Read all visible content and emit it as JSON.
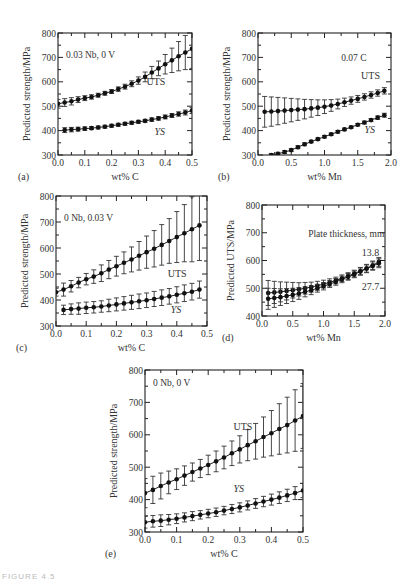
{
  "figure_caption": "FIGURE 4.5",
  "chart_data": [
    {
      "id": "a",
      "panel_label": "(a)",
      "type": "scatter",
      "title": "",
      "annotation": "0.03 Nb, 0 V",
      "xlabel": "wt% C",
      "ylabel": "Predicted strength/MPa",
      "xlim": [
        0,
        0.5
      ],
      "ylim": [
        300,
        800
      ],
      "xticks": [
        "0.0",
        "0.1",
        "0.2",
        "0.3",
        "0.4",
        "0.5"
      ],
      "yticks": [
        "300",
        "400",
        "500",
        "600",
        "700",
        "800"
      ],
      "grid": false,
      "series": [
        {
          "name": "UTS",
          "label_pos": [
            0.33,
            585
          ],
          "x": [
            0.0,
            0.025,
            0.05,
            0.075,
            0.1,
            0.125,
            0.15,
            0.175,
            0.2,
            0.225,
            0.25,
            0.275,
            0.3,
            0.325,
            0.35,
            0.375,
            0.4,
            0.425,
            0.45,
            0.475,
            0.5
          ],
          "y": [
            510,
            515,
            520,
            527,
            533,
            538,
            545,
            553,
            560,
            570,
            580,
            592,
            605,
            620,
            638,
            655,
            672,
            688,
            705,
            720,
            735
          ],
          "err": [
            18,
            16,
            15,
            12,
            10,
            9,
            8,
            8,
            8,
            9,
            10,
            12,
            15,
            20,
            25,
            30,
            40,
            50,
            60,
            70,
            80
          ]
        },
        {
          "name": "YS",
          "label_pos": [
            0.36,
            380
          ],
          "x": [
            0.025,
            0.05,
            0.075,
            0.1,
            0.125,
            0.15,
            0.175,
            0.2,
            0.225,
            0.25,
            0.275,
            0.3,
            0.325,
            0.35,
            0.375,
            0.4,
            0.425,
            0.45,
            0.475,
            0.5
          ],
          "y": [
            402,
            404,
            406,
            408,
            410,
            413,
            416,
            420,
            424,
            428,
            432,
            436,
            440,
            445,
            450,
            456,
            462,
            468,
            474,
            482
          ],
          "err": [
            10,
            9,
            8,
            7,
            6,
            6,
            6,
            6,
            6,
            6,
            6,
            6,
            6,
            7,
            7,
            8,
            8,
            9,
            10,
            12
          ]
        }
      ]
    },
    {
      "id": "b",
      "panel_label": "(b)",
      "type": "scatter",
      "title": "",
      "annotation": "0.07 C",
      "xlabel": "wt% Mn",
      "ylabel": "Predicted strength/MPa",
      "xlim": [
        0,
        2.0
      ],
      "ylim": [
        300,
        800
      ],
      "xticks": [
        "0.0",
        "0.5",
        "1.0",
        "1.5",
        "2.0"
      ],
      "yticks": [
        "300",
        "400",
        "500",
        "600",
        "700",
        "800"
      ],
      "grid": false,
      "series": [
        {
          "name": "UTS",
          "label_pos": [
            1.55,
            610
          ],
          "x": [
            0.1,
            0.2,
            0.3,
            0.4,
            0.5,
            0.6,
            0.7,
            0.8,
            0.9,
            1.0,
            1.1,
            1.2,
            1.3,
            1.4,
            1.5,
            1.6,
            1.7,
            1.8,
            1.9
          ],
          "y": [
            477,
            478,
            480,
            482,
            484,
            486,
            488,
            491,
            494,
            498,
            503,
            509,
            516,
            523,
            530,
            538,
            546,
            554,
            563
          ],
          "err": [
            63,
            60,
            56,
            52,
            48,
            44,
            40,
            36,
            32,
            28,
            24,
            20,
            17,
            15,
            14,
            13,
            13,
            13,
            13
          ]
        },
        {
          "name": "YS",
          "label_pos": [
            1.6,
            390
          ],
          "x": [
            0.2,
            0.3,
            0.4,
            0.5,
            0.6,
            0.7,
            0.8,
            0.9,
            1.0,
            1.1,
            1.2,
            1.3,
            1.4,
            1.5,
            1.6,
            1.7,
            1.8,
            1.9
          ],
          "y": [
            300,
            305,
            312,
            320,
            332,
            344,
            355,
            365,
            375,
            385,
            395,
            405,
            414,
            424,
            433,
            443,
            453,
            463
          ],
          "err": [
            6,
            6,
            6,
            6,
            6,
            6,
            5,
            5,
            5,
            5,
            5,
            5,
            5,
            5,
            6,
            6,
            7,
            8
          ]
        }
      ]
    },
    {
      "id": "c",
      "panel_label": "(c)",
      "type": "scatter",
      "title": "",
      "annotation": "0 Nb, 0.03 V",
      "xlabel": "wt% C",
      "ylabel": "Predicted strength/MPa",
      "xlim": [
        0,
        0.5
      ],
      "ylim": [
        300,
        800
      ],
      "xticks": [
        "0.0",
        "0.1",
        "0.2",
        "0.3",
        "0.4",
        "0.5"
      ],
      "yticks": [
        "300",
        "400",
        "500",
        "600",
        "700",
        "800"
      ],
      "grid": false,
      "series": [
        {
          "name": "UTS",
          "label_pos": [
            0.37,
            490
          ],
          "x": [
            0.0,
            0.025,
            0.05,
            0.075,
            0.1,
            0.125,
            0.15,
            0.175,
            0.2,
            0.225,
            0.25,
            0.275,
            0.3,
            0.325,
            0.35,
            0.375,
            0.4,
            0.425,
            0.45,
            0.475
          ],
          "y": [
            430,
            440,
            453,
            467,
            480,
            490,
            503,
            517,
            530,
            543,
            556,
            570,
            584,
            597,
            612,
            627,
            642,
            657,
            672,
            687
          ],
          "err": [
            15,
            25,
            22,
            20,
            22,
            26,
            32,
            35,
            38,
            42,
            48,
            55,
            62,
            70,
            78,
            86,
            98,
            110,
            125,
            135
          ]
        },
        {
          "name": "YS",
          "label_pos": [
            0.38,
            350
          ],
          "x": [
            0.025,
            0.05,
            0.075,
            0.1,
            0.125,
            0.15,
            0.175,
            0.2,
            0.225,
            0.25,
            0.275,
            0.3,
            0.325,
            0.35,
            0.375,
            0.4,
            0.425,
            0.45,
            0.475
          ],
          "y": [
            362,
            365,
            367,
            370,
            372,
            375,
            379,
            383,
            387,
            391,
            395,
            399,
            404,
            409,
            414,
            420,
            426,
            432,
            440
          ],
          "err": [
            18,
            20,
            22,
            22,
            22,
            22,
            24,
            25,
            26,
            27,
            28,
            28,
            29,
            30,
            30,
            31,
            32,
            32,
            33
          ]
        }
      ]
    },
    {
      "id": "d",
      "panel_label": "(d)",
      "type": "scatter",
      "title": "",
      "annotation": "Plate thickness, mm",
      "xlabel": "wt% Mn",
      "ylabel": "Predicted UTS/MPa",
      "xlim": [
        0,
        2.0
      ],
      "ylim": [
        400,
        800
      ],
      "xticks": [
        "0.0",
        "0.5",
        "1.0",
        "1.5",
        "2.0"
      ],
      "yticks": [
        "400",
        "500",
        "600",
        "700",
        "800"
      ],
      "grid": false,
      "series": [
        {
          "name": "13.8",
          "label_pos": [
            1.62,
            615
          ],
          "x": [
            0.1,
            0.2,
            0.3,
            0.4,
            0.5,
            0.6,
            0.7,
            0.8,
            0.9,
            1.0,
            1.1,
            1.2,
            1.3,
            1.4,
            1.5,
            1.6,
            1.7,
            1.8,
            1.9
          ],
          "y": [
            483,
            485,
            487,
            490,
            493,
            496,
            500,
            504,
            509,
            515,
            521,
            528,
            536,
            544,
            553,
            562,
            572,
            583,
            595
          ],
          "err": [
            45,
            40,
            36,
            32,
            28,
            24,
            21,
            18,
            16,
            14,
            13,
            12,
            12,
            12,
            12,
            13,
            14,
            15,
            16
          ]
        },
        {
          "name": "27.7",
          "label_pos": [
            1.62,
            492
          ],
          "x": [
            0.1,
            0.2,
            0.3,
            0.4,
            0.5,
            0.6,
            0.7,
            0.8,
            0.9,
            1.0,
            1.1,
            1.2,
            1.3,
            1.4,
            1.5,
            1.6,
            1.7,
            1.8,
            1.9
          ],
          "y": [
            462,
            465,
            468,
            472,
            476,
            481,
            487,
            493,
            500,
            507,
            515,
            523,
            532,
            541,
            550,
            560,
            570,
            580,
            590
          ],
          "err": [
            38,
            34,
            30,
            27,
            24,
            21,
            18,
            16,
            14,
            13,
            12,
            12,
            12,
            12,
            12,
            13,
            14,
            15,
            16
          ]
        }
      ]
    },
    {
      "id": "e",
      "panel_label": "(e)",
      "type": "scatter",
      "title": "",
      "annotation": "0 Nb, 0 V",
      "xlabel": "wt% C",
      "ylabel": "Predicted strength/MPa",
      "xlim": [
        0,
        0.5
      ],
      "ylim": [
        300,
        800
      ],
      "xticks": [
        "0.0",
        "0.1",
        "0.2",
        "0.3",
        "0.4",
        "0.5"
      ],
      "yticks": [
        "300",
        "400",
        "500",
        "600",
        "700",
        "800"
      ],
      "grid": false,
      "series": [
        {
          "name": "UTS",
          "label_pos": [
            0.28,
            615
          ],
          "x": [
            0.0,
            0.025,
            0.05,
            0.075,
            0.1,
            0.125,
            0.15,
            0.175,
            0.2,
            0.225,
            0.25,
            0.275,
            0.3,
            0.325,
            0.35,
            0.375,
            0.4,
            0.425,
            0.45,
            0.475,
            0.5
          ],
          "y": [
            420,
            430,
            442,
            453,
            463,
            474,
            485,
            496,
            507,
            518,
            530,
            543,
            555,
            568,
            580,
            593,
            605,
            618,
            630,
            644,
            658
          ],
          "err": [
            45,
            42,
            40,
            35,
            32,
            30,
            28,
            28,
            30,
            32,
            35,
            38,
            42,
            48,
            55,
            62,
            70,
            78,
            86,
            95,
            100
          ]
        },
        {
          "name": "YS",
          "label_pos": [
            0.28,
            425
          ],
          "x": [
            0.0,
            0.025,
            0.05,
            0.075,
            0.1,
            0.125,
            0.15,
            0.175,
            0.2,
            0.225,
            0.25,
            0.275,
            0.3,
            0.325,
            0.35,
            0.375,
            0.4,
            0.425,
            0.45,
            0.475,
            0.5
          ],
          "y": [
            330,
            333,
            335,
            338,
            341,
            345,
            349,
            353,
            357,
            361,
            366,
            371,
            376,
            382,
            388,
            394,
            400,
            406,
            413,
            420,
            428
          ],
          "err": [
            18,
            18,
            18,
            16,
            15,
            14,
            14,
            13,
            13,
            13,
            13,
            14,
            14,
            14,
            15,
            16,
            17,
            18,
            19,
            20,
            22
          ]
        }
      ]
    }
  ],
  "panels": {
    "a": {
      "label": "(a)",
      "annotation": "0.03 Nb, 0 V",
      "xlabel": "wt% C",
      "ylabel": "Predicted strength/MPa",
      "s1": "UTS",
      "s2": "YS"
    },
    "b": {
      "label": "(b)",
      "annotation": "0.07 C",
      "xlabel": "wt% Mn",
      "ylabel": "Predicted strength/MPa",
      "s1": "UTS",
      "s2": "YS"
    },
    "c": {
      "label": "(c)",
      "annotation": "0 Nb, 0.03 V",
      "xlabel": "wt% C",
      "ylabel": "Predicted strength/MPa",
      "s1": "UTS",
      "s2": "YS"
    },
    "d": {
      "label": "(d)",
      "annotation": "Plate thickness, mm",
      "xlabel": "wt% Mn",
      "ylabel": "Predicted UTS/MPa",
      "s1": "13.8",
      "s2": "27.7"
    },
    "e": {
      "label": "(e)",
      "annotation": "0 Nb, 0 V",
      "xlabel": "wt% C",
      "ylabel": "Predicted strength/MPa",
      "s1": "UTS",
      "s2": "YS"
    }
  }
}
